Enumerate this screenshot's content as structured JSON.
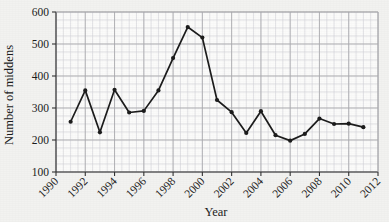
{
  "chart_data": {
    "type": "line",
    "title": "",
    "xlabel": "Year",
    "ylabel": "Number of middens",
    "xlim": [
      1990,
      2012
    ],
    "ylim": [
      100,
      600
    ],
    "xticks": [
      1990,
      1992,
      1994,
      1996,
      1998,
      2000,
      2002,
      2004,
      2006,
      2008,
      2010,
      2012
    ],
    "yticks": [
      100,
      200,
      300,
      400,
      500,
      600
    ],
    "xtick_labels": [
      "1990",
      "1992",
      "1994",
      "1996",
      "1998",
      "2000",
      "2002",
      "2004",
      "2006",
      "2008",
      "2010",
      "2012"
    ],
    "ytick_labels": [
      "100",
      "200",
      "300",
      "400",
      "500",
      "600"
    ],
    "grid": true,
    "grid_minor": true,
    "legend": null,
    "legend_position": "none",
    "marker": "filled-circle",
    "line_color": "#1c1c1c",
    "marker_color": "#1c1c1c",
    "x": [
      1991,
      1992,
      1993,
      1994,
      1995,
      1996,
      1997,
      1998,
      1999,
      2000,
      2001,
      2002,
      2003,
      2004,
      2005,
      2006,
      2007,
      2008,
      2009,
      2010,
      2011
    ],
    "values": [
      257,
      355,
      224,
      357,
      286,
      291,
      355,
      456,
      553,
      520,
      325,
      287,
      222,
      290,
      215,
      198,
      219,
      267,
      250,
      251,
      240
    ],
    "series": [
      {
        "name": "Number of middens",
        "values": [
          257,
          355,
          224,
          357,
          286,
          291,
          355,
          456,
          553,
          520,
          325,
          287,
          222,
          290,
          215,
          198,
          219,
          267,
          250,
          251,
          240
        ]
      }
    ],
    "xtick_rotation": -45
  },
  "colors": {
    "background": "#f2f2f0",
    "plot_background": "#fbfbfa",
    "axis": "#333333",
    "grid_major": "#a8a8ac",
    "grid_minor": "#d2d2d6",
    "data": "#1c1c1c"
  }
}
